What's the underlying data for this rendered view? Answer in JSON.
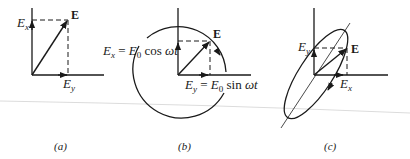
{
  "figure": {
    "panels": [
      {
        "id": "a",
        "caption": "(a)",
        "caption_letter": "a",
        "type": "linear polarization",
        "vector_label": "E",
        "x_component_label": "E",
        "x_component_sub": "x",
        "y_component_label": "E",
        "y_component_sub": "y"
      },
      {
        "id": "b",
        "caption": "(b)",
        "caption_letter": "b",
        "type": "circular polarization",
        "vector_label": "E",
        "x_eq": {
          "lhs": "E",
          "lhs_sub": "x",
          "eq": " = ",
          "amp": "E",
          "amp_sub": "0",
          "func": " cos ",
          "arg": "ωt"
        },
        "y_eq": {
          "lhs": "E",
          "lhs_sub": "y",
          "eq": " = ",
          "amp": "E",
          "amp_sub": "0",
          "func": " sin ",
          "arg": "ωt"
        }
      },
      {
        "id": "c",
        "caption": "(c)",
        "caption_letter": "c",
        "type": "elliptical polarization",
        "vector_label": "E",
        "y_component_label": "E",
        "y_component_sub": "y",
        "x_component_label": "E",
        "x_component_sub": "x"
      }
    ],
    "colors": {
      "ink": "#1a1a1a",
      "background": "#ffffff",
      "scan_line": "#d8d8d8"
    }
  }
}
